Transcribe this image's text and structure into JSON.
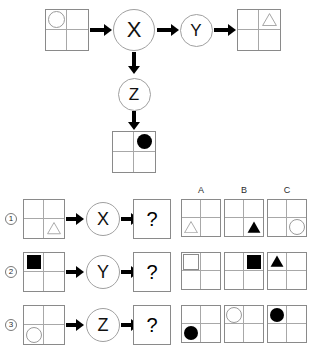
{
  "watermark": "",
  "diagram": {
    "input_grid": {
      "name": "input-grid",
      "cells": [
        {
          "pos": "top-left",
          "shape": "circle",
          "fill": "open"
        },
        {
          "pos": "top-right",
          "shape": "none",
          "fill": "none"
        },
        {
          "pos": "bottom-left",
          "shape": "none",
          "fill": "none"
        },
        {
          "pos": "bottom-right",
          "shape": "none",
          "fill": "none"
        }
      ]
    },
    "node_x": {
      "label": "X"
    },
    "node_y": {
      "label": "Y"
    },
    "node_z": {
      "label": "Z"
    },
    "output_grid_y": {
      "name": "output-grid-y",
      "cells": [
        {
          "pos": "top-left",
          "shape": "none",
          "fill": "none"
        },
        {
          "pos": "top-right",
          "shape": "triangle",
          "fill": "open"
        },
        {
          "pos": "bottom-left",
          "shape": "none",
          "fill": "none"
        },
        {
          "pos": "bottom-right",
          "shape": "none",
          "fill": "none"
        }
      ]
    },
    "output_grid_z": {
      "name": "output-grid-z",
      "cells": [
        {
          "pos": "top-left",
          "shape": "none",
          "fill": "none"
        },
        {
          "pos": "top-right",
          "shape": "circle",
          "fill": "filled"
        },
        {
          "pos": "bottom-left",
          "shape": "none",
          "fill": "none"
        },
        {
          "pos": "bottom-right",
          "shape": "none",
          "fill": "none"
        }
      ]
    }
  },
  "question_section": {
    "column_headers": [
      "A",
      "B",
      "C"
    ],
    "question_mark": "?",
    "rows": [
      {
        "number": "1",
        "operator": "X",
        "input_grid": [
          {
            "pos": "top-left",
            "shape": "none",
            "fill": "none"
          },
          {
            "pos": "top-right",
            "shape": "none",
            "fill": "none"
          },
          {
            "pos": "bottom-left",
            "shape": "none",
            "fill": "none"
          },
          {
            "pos": "bottom-right",
            "shape": "triangle",
            "fill": "open"
          }
        ],
        "options": [
          {
            "label": "A",
            "cells": [
              {
                "pos": "top-left",
                "shape": "none",
                "fill": "none"
              },
              {
                "pos": "top-right",
                "shape": "none",
                "fill": "none"
              },
              {
                "pos": "bottom-left",
                "shape": "triangle",
                "fill": "open"
              },
              {
                "pos": "bottom-right",
                "shape": "none",
                "fill": "none"
              }
            ]
          },
          {
            "label": "B",
            "cells": [
              {
                "pos": "top-left",
                "shape": "none",
                "fill": "none"
              },
              {
                "pos": "top-right",
                "shape": "none",
                "fill": "none"
              },
              {
                "pos": "bottom-left",
                "shape": "none",
                "fill": "none"
              },
              {
                "pos": "bottom-right",
                "shape": "triangle",
                "fill": "filled"
              }
            ]
          },
          {
            "label": "C",
            "cells": [
              {
                "pos": "top-left",
                "shape": "none",
                "fill": "none"
              },
              {
                "pos": "top-right",
                "shape": "none",
                "fill": "none"
              },
              {
                "pos": "bottom-left",
                "shape": "none",
                "fill": "none"
              },
              {
                "pos": "bottom-right",
                "shape": "circle",
                "fill": "open"
              }
            ]
          }
        ]
      },
      {
        "number": "2",
        "operator": "Y",
        "input_grid": [
          {
            "pos": "top-left",
            "shape": "square",
            "fill": "filled"
          },
          {
            "pos": "top-right",
            "shape": "none",
            "fill": "none"
          },
          {
            "pos": "bottom-left",
            "shape": "none",
            "fill": "none"
          },
          {
            "pos": "bottom-right",
            "shape": "none",
            "fill": "none"
          }
        ],
        "options": [
          {
            "label": "A",
            "cells": [
              {
                "pos": "top-left",
                "shape": "square",
                "fill": "open"
              },
              {
                "pos": "top-right",
                "shape": "none",
                "fill": "none"
              },
              {
                "pos": "bottom-left",
                "shape": "none",
                "fill": "none"
              },
              {
                "pos": "bottom-right",
                "shape": "none",
                "fill": "none"
              }
            ]
          },
          {
            "label": "B",
            "cells": [
              {
                "pos": "top-left",
                "shape": "none",
                "fill": "none"
              },
              {
                "pos": "top-right",
                "shape": "square",
                "fill": "filled"
              },
              {
                "pos": "bottom-left",
                "shape": "none",
                "fill": "none"
              },
              {
                "pos": "bottom-right",
                "shape": "none",
                "fill": "none"
              }
            ]
          },
          {
            "label": "C",
            "cells": [
              {
                "pos": "top-left",
                "shape": "triangle",
                "fill": "filled"
              },
              {
                "pos": "top-right",
                "shape": "none",
                "fill": "none"
              },
              {
                "pos": "bottom-left",
                "shape": "none",
                "fill": "none"
              },
              {
                "pos": "bottom-right",
                "shape": "none",
                "fill": "none"
              }
            ]
          }
        ]
      },
      {
        "number": "3",
        "operator": "Z",
        "input_grid": [
          {
            "pos": "top-left",
            "shape": "none",
            "fill": "none"
          },
          {
            "pos": "top-right",
            "shape": "none",
            "fill": "none"
          },
          {
            "pos": "bottom-left",
            "shape": "circle",
            "fill": "open"
          },
          {
            "pos": "bottom-right",
            "shape": "none",
            "fill": "none"
          }
        ],
        "options": [
          {
            "label": "A",
            "cells": [
              {
                "pos": "top-left",
                "shape": "none",
                "fill": "none"
              },
              {
                "pos": "top-right",
                "shape": "none",
                "fill": "none"
              },
              {
                "pos": "bottom-left",
                "shape": "circle",
                "fill": "filled"
              },
              {
                "pos": "bottom-right",
                "shape": "none",
                "fill": "none"
              }
            ]
          },
          {
            "label": "B",
            "cells": [
              {
                "pos": "top-left",
                "shape": "circle",
                "fill": "open"
              },
              {
                "pos": "top-right",
                "shape": "none",
                "fill": "none"
              },
              {
                "pos": "bottom-left",
                "shape": "none",
                "fill": "none"
              },
              {
                "pos": "bottom-right",
                "shape": "none",
                "fill": "none"
              }
            ]
          },
          {
            "label": "C",
            "cells": [
              {
                "pos": "top-left",
                "shape": "circle",
                "fill": "filled"
              },
              {
                "pos": "top-right",
                "shape": "none",
                "fill": "none"
              },
              {
                "pos": "bottom-left",
                "shape": "none",
                "fill": "none"
              },
              {
                "pos": "bottom-right",
                "shape": "none",
                "fill": "none"
              }
            ]
          }
        ]
      }
    ]
  },
  "colors": {
    "shape_fill": "#000000",
    "shape_outline": "#9a9a9a",
    "grid_border": "#8a8a8a",
    "grid_inner": "#a8a8a8",
    "node_border": "#a0a0a0",
    "arrow": "#000000"
  }
}
